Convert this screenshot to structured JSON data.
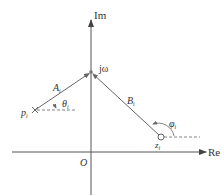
{
  "axes": {
    "imag_label": "Im",
    "real_label": "Re",
    "origin_label": "O"
  },
  "points": {
    "jw": {
      "label": "jω"
    },
    "pole": {
      "label": "p",
      "sub": "i",
      "marker": "cross"
    },
    "zero": {
      "label": "z",
      "sub": "i",
      "marker": "circle"
    }
  },
  "vectors": {
    "A": {
      "label": "A",
      "sub": "i",
      "from": "pole",
      "to": "jw"
    },
    "B": {
      "label": "B",
      "sub": "i",
      "from": "zero",
      "to": "jw"
    }
  },
  "angles": {
    "theta": {
      "label": "θ",
      "sub": "i"
    },
    "phi": {
      "label": "φ",
      "sub": "i"
    }
  },
  "colors": {
    "line": "#555555",
    "text": "#333333"
  }
}
